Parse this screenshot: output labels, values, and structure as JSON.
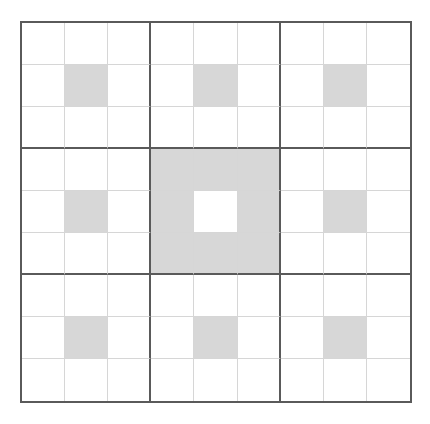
{
  "diagram": {
    "title": "",
    "caption": "",
    "grid": {
      "rows": 9,
      "cols": 9,
      "box_size": 3,
      "colors": {
        "background": "#ffffff",
        "shaded": "#d7d7d7",
        "thin_line": "#d6d6d6",
        "thick_line": "#5a5a5a"
      },
      "shaded_cells": [
        [
          1,
          1
        ],
        [
          1,
          4
        ],
        [
          1,
          7
        ],
        [
          3,
          3
        ],
        [
          3,
          4
        ],
        [
          3,
          5
        ],
        [
          4,
          1
        ],
        [
          4,
          3
        ],
        [
          4,
          5
        ],
        [
          4,
          7
        ],
        [
          5,
          3
        ],
        [
          5,
          4
        ],
        [
          5,
          5
        ],
        [
          7,
          1
        ],
        [
          7,
          4
        ],
        [
          7,
          7
        ]
      ],
      "unshaded_note": "center cell [4,4] is white within the shaded center box"
    }
  }
}
